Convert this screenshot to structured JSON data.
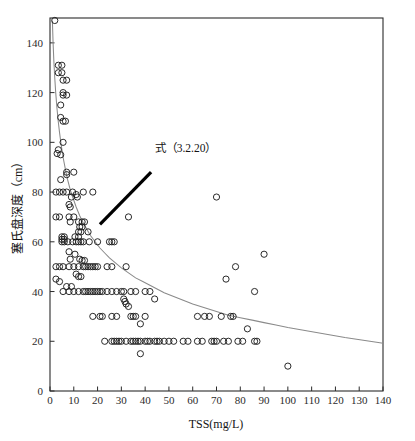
{
  "chart_data": {
    "type": "scatter",
    "title": "",
    "xlabel": "TSS(mg/L)",
    "ylabel": "塞氏盘深度（cm）",
    "xlim": [
      0,
      140
    ],
    "ylim": [
      0,
      150
    ],
    "grid": false,
    "legend_position": "none",
    "xticks": [
      0,
      10,
      20,
      30,
      40,
      50,
      60,
      70,
      80,
      90,
      100,
      110,
      120,
      130,
      140
    ],
    "xtick_labels": [
      "0",
      "10",
      "20",
      "30",
      "40",
      "50",
      "60",
      "70",
      "80",
      "90",
      "100",
      "110",
      "120",
      "130",
      "140"
    ],
    "yticks": [
      0,
      20,
      40,
      60,
      80,
      100,
      120,
      140
    ],
    "ytick_labels": [
      "0",
      "20",
      "40",
      "60",
      "80",
      "100",
      "120",
      "140"
    ],
    "marker_style": "open-circle",
    "marker_radius_px": 3.1,
    "annotations": [
      {
        "text": "式（3.2.20）",
        "name": "equation-callout",
        "text_x": 44.0,
        "text_y": 96.0,
        "arrow_from_x": 42.5,
        "arrow_from_y": 88.0,
        "arrow_to_x": 21.0,
        "arrow_to_y": 67.0
      }
    ],
    "fit_curve": {
      "name": "power-law-fit",
      "color": "#8a8a8a",
      "points": [
        [
          1.0,
          149.0
        ],
        [
          1.3,
          140.0
        ],
        [
          1.6,
          133.0
        ],
        [
          2.0,
          126.0
        ],
        [
          2.4,
          120.0
        ],
        [
          2.9,
          114.0
        ],
        [
          3.4,
          109.0
        ],
        [
          4.0,
          104.0
        ],
        [
          4.7,
          99.0
        ],
        [
          5.5,
          94.0
        ],
        [
          6.4,
          89.5
        ],
        [
          7.4,
          85.0
        ],
        [
          8.5,
          81.0
        ],
        [
          9.7,
          77.5
        ],
        [
          11.0,
          74.0
        ],
        [
          12.5,
          70.5
        ],
        [
          14.0,
          67.5
        ],
        [
          15.5,
          65.0
        ],
        [
          17.0,
          62.5
        ],
        [
          19.0,
          60.0
        ],
        [
          21.0,
          57.5
        ],
        [
          23.0,
          55.5
        ],
        [
          25.0,
          53.5
        ],
        [
          27.5,
          51.5
        ],
        [
          30.0,
          49.5
        ],
        [
          33.0,
          47.5
        ],
        [
          36.0,
          45.5
        ],
        [
          39.0,
          44.0
        ],
        [
          42.0,
          42.5
        ],
        [
          45.0,
          41.0
        ],
        [
          48.0,
          39.5
        ],
        [
          52.0,
          38.0
        ],
        [
          56.0,
          36.5
        ],
        [
          60.0,
          35.0
        ],
        [
          65.0,
          33.5
        ],
        [
          70.0,
          32.0
        ],
        [
          75.0,
          30.5
        ],
        [
          80.0,
          29.5
        ],
        [
          85.0,
          28.5
        ],
        [
          90.0,
          27.5
        ],
        [
          95.0,
          26.5
        ],
        [
          100.0,
          25.5
        ],
        [
          106.0,
          24.5
        ],
        [
          112.0,
          23.5
        ],
        [
          118.0,
          22.5
        ],
        [
          124.0,
          21.5
        ],
        [
          131.0,
          20.5
        ],
        [
          138.0,
          19.5
        ],
        [
          140.0,
          19.2
        ]
      ]
    },
    "points": [
      [
        2.0,
        149.0
      ],
      [
        3.5,
        131.0
      ],
      [
        5.0,
        131.0
      ],
      [
        3.5,
        128.0
      ],
      [
        5.0,
        128.0
      ],
      [
        5.5,
        125.0
      ],
      [
        7.0,
        125.0
      ],
      [
        5.5,
        120.0
      ],
      [
        5.5,
        119.0
      ],
      [
        7.0,
        119.0
      ],
      [
        4.5,
        115.0
      ],
      [
        4.5,
        110.0
      ],
      [
        5.5,
        108.5
      ],
      [
        6.5,
        108.5
      ],
      [
        5.5,
        100.0
      ],
      [
        3.5,
        97.0
      ],
      [
        3.0,
        95.5
      ],
      [
        4.5,
        95.0
      ],
      [
        7.0,
        88.0
      ],
      [
        10.0,
        88.0
      ],
      [
        7.0,
        87.0
      ],
      [
        4.5,
        85.0
      ],
      [
        2.5,
        80.0
      ],
      [
        4.0,
        80.0
      ],
      [
        5.5,
        80.0
      ],
      [
        7.0,
        80.0
      ],
      [
        9.5,
        80.0
      ],
      [
        11.0,
        79.0
      ],
      [
        14.0,
        80.0
      ],
      [
        18.0,
        80.0
      ],
      [
        9.0,
        78.0
      ],
      [
        11.5,
        78.0
      ],
      [
        8.0,
        75.0
      ],
      [
        8.5,
        74.0
      ],
      [
        2.5,
        70.0
      ],
      [
        4.0,
        70.0
      ],
      [
        8.0,
        70.0
      ],
      [
        10.0,
        70.0
      ],
      [
        33.0,
        70.0
      ],
      [
        70.0,
        78.0
      ],
      [
        8.5,
        68.0
      ],
      [
        12.0,
        68.0
      ],
      [
        13.5,
        68.0
      ],
      [
        14.5,
        68.0
      ],
      [
        12.5,
        66.0
      ],
      [
        13.5,
        66.0
      ],
      [
        12.0,
        64.0
      ],
      [
        13.0,
        64.0
      ],
      [
        16.0,
        64.0
      ],
      [
        5.0,
        62.0
      ],
      [
        6.0,
        62.0
      ],
      [
        10.5,
        62.0
      ],
      [
        12.0,
        62.0
      ],
      [
        5.0,
        61.0
      ],
      [
        6.0,
        61.0
      ],
      [
        5.0,
        60.0
      ],
      [
        6.0,
        60.0
      ],
      [
        7.5,
        60.0
      ],
      [
        9.5,
        60.0
      ],
      [
        11.0,
        60.0
      ],
      [
        12.0,
        60.0
      ],
      [
        13.0,
        60.0
      ],
      [
        14.0,
        60.0
      ],
      [
        16.5,
        60.0
      ],
      [
        20.0,
        60.0
      ],
      [
        25.0,
        60.0
      ],
      [
        26.0,
        60.0
      ],
      [
        27.0,
        60.0
      ],
      [
        8.0,
        56.0
      ],
      [
        10.5,
        55.0
      ],
      [
        90.0,
        55.0
      ],
      [
        8.5,
        53.0
      ],
      [
        12.5,
        53.0
      ],
      [
        13.5,
        52.5
      ],
      [
        14.5,
        52.5
      ],
      [
        2.5,
        50.0
      ],
      [
        4.0,
        50.0
      ],
      [
        5.5,
        50.0
      ],
      [
        8.0,
        50.0
      ],
      [
        10.0,
        50.0
      ],
      [
        12.0,
        50.0
      ],
      [
        14.0,
        50.0
      ],
      [
        15.0,
        50.0
      ],
      [
        16.0,
        50.0
      ],
      [
        17.0,
        50.0
      ],
      [
        18.0,
        50.0
      ],
      [
        19.0,
        50.0
      ],
      [
        20.0,
        50.0
      ],
      [
        24.0,
        50.0
      ],
      [
        26.0,
        50.0
      ],
      [
        32.0,
        50.0
      ],
      [
        78.0,
        50.0
      ],
      [
        11.0,
        47.0
      ],
      [
        12.0,
        46.0
      ],
      [
        13.0,
        46.0
      ],
      [
        2.5,
        45.0
      ],
      [
        4.0,
        44.0
      ],
      [
        74.0,
        45.0
      ],
      [
        7.0,
        42.0
      ],
      [
        9.0,
        42.0
      ],
      [
        5.5,
        40.0
      ],
      [
        8.0,
        40.0
      ],
      [
        10.0,
        40.0
      ],
      [
        12.0,
        40.0
      ],
      [
        14.0,
        40.0
      ],
      [
        15.0,
        40.0
      ],
      [
        16.0,
        40.0
      ],
      [
        17.0,
        40.0
      ],
      [
        18.0,
        40.0
      ],
      [
        19.0,
        40.0
      ],
      [
        20.0,
        40.0
      ],
      [
        21.0,
        40.0
      ],
      [
        22.0,
        40.0
      ],
      [
        24.0,
        40.0
      ],
      [
        26.0,
        40.0
      ],
      [
        28.0,
        40.0
      ],
      [
        30.0,
        40.0
      ],
      [
        31.0,
        40.0
      ],
      [
        34.0,
        40.0
      ],
      [
        36.0,
        40.0
      ],
      [
        40.0,
        40.0
      ],
      [
        42.0,
        40.0
      ],
      [
        86.0,
        40.0
      ],
      [
        31.0,
        37.0
      ],
      [
        31.5,
        36.0
      ],
      [
        32.0,
        35.0
      ],
      [
        33.0,
        34.0
      ],
      [
        44.0,
        37.0
      ],
      [
        18.0,
        30.0
      ],
      [
        21.0,
        30.0
      ],
      [
        22.0,
        30.0
      ],
      [
        26.0,
        30.0
      ],
      [
        28.0,
        30.0
      ],
      [
        34.0,
        30.0
      ],
      [
        35.0,
        30.0
      ],
      [
        36.0,
        30.0
      ],
      [
        40.0,
        30.0
      ],
      [
        62.0,
        30.0
      ],
      [
        65.0,
        30.0
      ],
      [
        67.0,
        30.0
      ],
      [
        72.0,
        30.0
      ],
      [
        76.0,
        30.0
      ],
      [
        77.0,
        30.0
      ],
      [
        38.0,
        27.0
      ],
      [
        83.0,
        25.0
      ],
      [
        23.0,
        20.0
      ],
      [
        26.0,
        20.0
      ],
      [
        27.0,
        20.0
      ],
      [
        28.0,
        20.0
      ],
      [
        29.0,
        20.0
      ],
      [
        30.0,
        20.0
      ],
      [
        32.0,
        20.0
      ],
      [
        34.0,
        20.0
      ],
      [
        35.0,
        20.0
      ],
      [
        36.0,
        20.0
      ],
      [
        37.0,
        20.0
      ],
      [
        38.0,
        20.0
      ],
      [
        40.0,
        20.0
      ],
      [
        41.0,
        20.0
      ],
      [
        42.0,
        20.0
      ],
      [
        44.0,
        20.0
      ],
      [
        45.0,
        20.0
      ],
      [
        46.0,
        20.0
      ],
      [
        48.0,
        20.0
      ],
      [
        50.0,
        20.0
      ],
      [
        52.0,
        20.0
      ],
      [
        56.0,
        20.0
      ],
      [
        58.0,
        20.0
      ],
      [
        62.0,
        20.0
      ],
      [
        64.0,
        20.0
      ],
      [
        68.0,
        20.0
      ],
      [
        69.0,
        20.0
      ],
      [
        70.0,
        20.0
      ],
      [
        73.0,
        20.0
      ],
      [
        75.0,
        20.0
      ],
      [
        79.0,
        20.0
      ],
      [
        81.0,
        20.0
      ],
      [
        86.0,
        20.0
      ],
      [
        87.0,
        20.0
      ],
      [
        38.0,
        15.0
      ],
      [
        100.0,
        10.0
      ]
    ]
  }
}
